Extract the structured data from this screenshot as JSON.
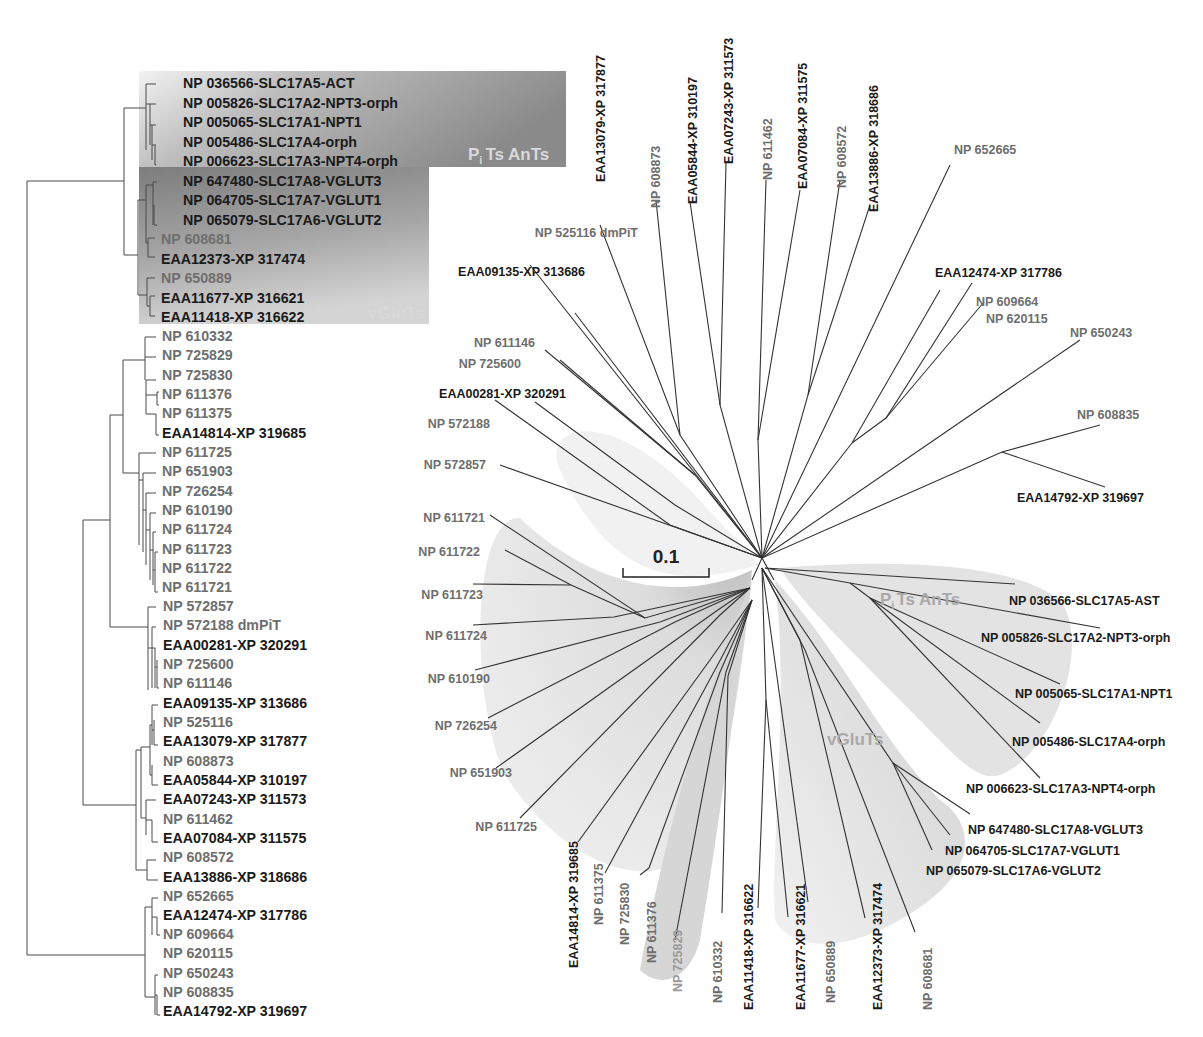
{
  "figure": {
    "type": "phylogenetic-tree-figure",
    "scale_bar": {
      "label": "0.1"
    },
    "colors": {
      "black_label": "#1a1a1a",
      "gray_label": "#6e6e6e",
      "light_gray_label": "#9a9a9a",
      "branch": "#3a3a3a",
      "clade_shade_dark": "#8a8a8a",
      "clade_shade_light": "#e2e2e2"
    }
  },
  "rectangular_tree": {
    "clades": [
      {
        "name": "pits_ants",
        "label": "PᵢTs AnTs",
        "label_main": "P",
        "label_sub": "i",
        "label_rest": "Ts AnTs"
      },
      {
        "name": "vgluts",
        "label": "vGluTs"
      }
    ],
    "leaves": [
      {
        "text": "NP 036566-SLC17A5-ACT",
        "style": "black"
      },
      {
        "text": "NP 005826-SLC17A2-NPT3-orph",
        "style": "black"
      },
      {
        "text": "NP 005065-SLC17A1-NPT1",
        "style": "black"
      },
      {
        "text": "NP 005486-SLC17A4-orph",
        "style": "black"
      },
      {
        "text": "NP 006623-SLC17A3-NPT4-orph",
        "style": "black"
      },
      {
        "text": "NP 647480-SLC17A8-VGLUT3",
        "style": "black"
      },
      {
        "text": "NP 064705-SLC17A7-VGLUT1",
        "style": "black"
      },
      {
        "text": "NP 065079-SLC17A6-VGLUT2",
        "style": "black"
      },
      {
        "text": "NP 608681",
        "style": "gray"
      },
      {
        "text": "EAA12373-XP 317474",
        "style": "black"
      },
      {
        "text": "NP 650889",
        "style": "gray"
      },
      {
        "text": "EAA11677-XP 316621",
        "style": "black"
      },
      {
        "text": "EAA11418-XP 316622",
        "style": "black"
      },
      {
        "text": "NP 610332",
        "style": "gray"
      },
      {
        "text": "NP 725829",
        "style": "gray"
      },
      {
        "text": "NP 725830",
        "style": "gray"
      },
      {
        "text": "NP 611376",
        "style": "gray"
      },
      {
        "text": "NP 611375",
        "style": "gray"
      },
      {
        "text": "EAA14814-XP 319685",
        "style": "black"
      },
      {
        "text": "NP 611725",
        "style": "gray"
      },
      {
        "text": "NP 651903",
        "style": "gray"
      },
      {
        "text": "NP 726254",
        "style": "gray"
      },
      {
        "text": "NP 610190",
        "style": "gray"
      },
      {
        "text": "NP 611724",
        "style": "gray"
      },
      {
        "text": "NP 611723",
        "style": "gray"
      },
      {
        "text": "NP 611722",
        "style": "gray"
      },
      {
        "text": "NP 611721",
        "style": "gray"
      },
      {
        "text": "NP 572857",
        "style": "gray"
      },
      {
        "text": "NP 572188 dmPiT",
        "style": "gray"
      },
      {
        "text": "EAA00281-XP 320291",
        "style": "black"
      },
      {
        "text": "NP 725600",
        "style": "gray"
      },
      {
        "text": "NP 611146",
        "style": "gray"
      },
      {
        "text": "EAA09135-XP 313686",
        "style": "black"
      },
      {
        "text": "NP 525116",
        "style": "gray"
      },
      {
        "text": "EAA13079-XP 317877",
        "style": "black"
      },
      {
        "text": "NP 608873",
        "style": "gray"
      },
      {
        "text": "EAA05844-XP 310197",
        "style": "black"
      },
      {
        "text": "EAA07243-XP 311573",
        "style": "black"
      },
      {
        "text": "NP 611462",
        "style": "gray"
      },
      {
        "text": "EAA07084-XP 311575",
        "style": "black"
      },
      {
        "text": "NP 608572",
        "style": "gray"
      },
      {
        "text": "EAA13886-XP 318686",
        "style": "black"
      },
      {
        "text": "NP 652665",
        "style": "gray"
      },
      {
        "text": "EAA12474-XP 317786",
        "style": "black"
      },
      {
        "text": "NP 609664",
        "style": "gray"
      },
      {
        "text": "NP 620115",
        "style": "gray"
      },
      {
        "text": "NP 650243",
        "style": "gray"
      },
      {
        "text": "NP 608835",
        "style": "gray"
      },
      {
        "text": "EAA14792-XP 319697",
        "style": "black"
      }
    ]
  },
  "radial_tree": {
    "center": [
      762,
      562
    ],
    "clade_labels": [
      {
        "name": "pits_ants",
        "label_main": "P",
        "label_sub": "i",
        "label_rest": "Ts AnTs"
      },
      {
        "name": "vgluts",
        "label": "vGluTs"
      }
    ],
    "leaves": [
      {
        "text": "EAA13079-XP 317877",
        "style": "black",
        "rotate": true
      },
      {
        "text": "NP 608873",
        "style": "gray",
        "rotate": true
      },
      {
        "text": "EAA05844-XP 310197",
        "style": "black",
        "rotate": true
      },
      {
        "text": "EAA07243-XP 311573",
        "style": "black",
        "rotate": true
      },
      {
        "text": "NP 611462",
        "style": "gray",
        "rotate": true
      },
      {
        "text": "EAA07084-XP 311575",
        "style": "black",
        "rotate": true
      },
      {
        "text": "NP 608572",
        "style": "gray",
        "rotate": true
      },
      {
        "text": "EAA13886-XP 318686",
        "style": "black",
        "rotate": true
      },
      {
        "text": "NP 652665",
        "style": "gray",
        "rotate": false
      },
      {
        "text": "EAA12474-XP 317786",
        "style": "black",
        "rotate": false
      },
      {
        "text": "NP 609664",
        "style": "gray",
        "rotate": false
      },
      {
        "text": "NP 620115",
        "style": "gray",
        "rotate": false
      },
      {
        "text": "NP 650243",
        "style": "gray",
        "rotate": false
      },
      {
        "text": "NP 608835",
        "style": "gray",
        "rotate": false
      },
      {
        "text": "EAA14792-XP 319697",
        "style": "black",
        "rotate": false
      },
      {
        "text": "NP 036566-SLC17A5-AST",
        "style": "black",
        "rotate": false
      },
      {
        "text": "NP 005826-SLC17A2-NPT3-orph",
        "style": "black",
        "rotate": false
      },
      {
        "text": "NP 005065-SLC17A1-NPT1",
        "style": "black",
        "rotate": false
      },
      {
        "text": "NP 005486-SLC17A4-orph",
        "style": "black",
        "rotate": false
      },
      {
        "text": "NP 006623-SLC17A3-NPT4-orph",
        "style": "black",
        "rotate": false
      },
      {
        "text": "NP 647480-SLC17A8-VGLUT3",
        "style": "black",
        "rotate": false
      },
      {
        "text": "NP 064705-SLC17A7-VGLUT1",
        "style": "black",
        "rotate": false
      },
      {
        "text": "NP 065079-SLC17A6-VGLUT2",
        "style": "black",
        "rotate": false
      },
      {
        "text": "NP 608681",
        "style": "gray",
        "rotate": true
      },
      {
        "text": "EAA12373-XP 317474",
        "style": "black",
        "rotate": true
      },
      {
        "text": "NP 650889",
        "style": "gray",
        "rotate": true
      },
      {
        "text": "EAA11677-XP 316621",
        "style": "black",
        "rotate": true
      },
      {
        "text": "EAA11418-XP 316622",
        "style": "black",
        "rotate": true
      },
      {
        "text": "NP 610332",
        "style": "gray",
        "rotate": true
      },
      {
        "text": "NP 725829",
        "style": "lightgray",
        "rotate": true
      },
      {
        "text": "NP 611376",
        "style": "gray",
        "rotate": true
      },
      {
        "text": "NP 725830",
        "style": "gray",
        "rotate": true
      },
      {
        "text": "NP 611375",
        "style": "gray",
        "rotate": true
      },
      {
        "text": "EAA14814-XP 319685",
        "style": "black",
        "rotate": true
      },
      {
        "text": "NP 611725",
        "style": "gray",
        "rotate": false
      },
      {
        "text": "NP 651903",
        "style": "gray",
        "rotate": false
      },
      {
        "text": "NP 726254",
        "style": "gray",
        "rotate": false
      },
      {
        "text": "NP 610190",
        "style": "gray",
        "rotate": false
      },
      {
        "text": "NP 611724",
        "style": "gray",
        "rotate": false
      },
      {
        "text": "NP 611723",
        "style": "gray",
        "rotate": false
      },
      {
        "text": "NP 611722",
        "style": "gray",
        "rotate": false
      },
      {
        "text": "NP 611721",
        "style": "gray",
        "rotate": false
      },
      {
        "text": "NP 572857",
        "style": "gray",
        "rotate": false
      },
      {
        "text": "NP 572188",
        "style": "gray",
        "rotate": false
      },
      {
        "text": "EAA00281-XP 320291",
        "style": "black",
        "rotate": false
      },
      {
        "text": "NP 725600",
        "style": "gray",
        "rotate": false
      },
      {
        "text": "NP 611146",
        "style": "gray",
        "rotate": false
      },
      {
        "text": "EAA09135-XP 313686",
        "style": "black",
        "rotate": false
      },
      {
        "text": "NP 525116 dmPiT",
        "style": "gray",
        "rotate": false
      }
    ]
  }
}
